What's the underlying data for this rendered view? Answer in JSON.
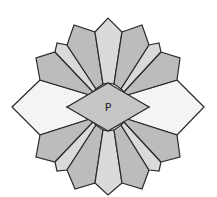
{
  "diagram": {
    "type": "geometric-rosette",
    "center_label": "P",
    "colors": {
      "outline": "#2a2a2a",
      "white_petal": "#f4f4f4",
      "light_petal": "#dadada",
      "dark_petal": "#bcbcbc",
      "center_diamond": "#c6c6c6",
      "background": "#ffffff"
    },
    "petals": [
      {
        "name": "petal-left",
        "shade": "white",
        "points": "12,107 40,80 93,96 67,107 93,118 40,135"
      },
      {
        "name": "petal-right",
        "shade": "white",
        "points": "204,107 177,80 124,96 149,107 124,118 177,135"
      },
      {
        "name": "petal-upper-left-outer",
        "shade": "dark",
        "points": "40,80 36,58 55,52 93,92 93,96"
      },
      {
        "name": "petal-upper-left-mid",
        "shade": "light",
        "points": "55,52 57,43 67,45 96,89 93,92"
      },
      {
        "name": "petal-upper-left-inner",
        "shade": "dark",
        "points": "67,45 74,25 95,32 103,84 96,89"
      },
      {
        "name": "petal-top",
        "shade": "light",
        "points": "95,32 108,18 122,32 114,84 108,83 103,84"
      },
      {
        "name": "petal-upper-right-inner",
        "shade": "dark",
        "points": "122,32 142,25 149,45 121,89 114,84"
      },
      {
        "name": "petal-upper-right-mid",
        "shade": "light",
        "points": "149,45 159,43 161,52 124,92 121,89"
      },
      {
        "name": "petal-upper-right-outer",
        "shade": "dark",
        "points": "161,52 180,58 177,80 124,96 124,92"
      },
      {
        "name": "petal-lower-left-outer",
        "shade": "dark",
        "points": "40,135 36,157 55,162 93,122 93,118"
      },
      {
        "name": "petal-lower-left-mid",
        "shade": "light",
        "points": "55,162 57,171 67,170 96,125 93,122"
      },
      {
        "name": "petal-lower-left-inner",
        "shade": "dark",
        "points": "67,170 75,189 95,183 103,130 96,125"
      },
      {
        "name": "petal-bottom",
        "shade": "light",
        "points": "95,183 108,195 122,183 114,130 108,131 103,130"
      },
      {
        "name": "petal-lower-right-inner",
        "shade": "dark",
        "points": "122,183 142,189 149,170 121,125 114,130"
      },
      {
        "name": "petal-lower-right-mid",
        "shade": "light",
        "points": "149,170 159,171 161,162 124,122 121,125"
      },
      {
        "name": "petal-lower-right-outer",
        "shade": "dark",
        "points": "161,162 180,157 177,135 124,118 124,122"
      }
    ],
    "center_diamond": {
      "points": "108,83 149,107 108,131 67,107"
    }
  }
}
